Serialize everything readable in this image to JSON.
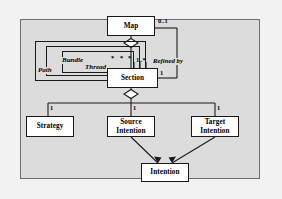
{
  "diagram": {
    "background_color": "#f2f2f2",
    "panel_color": "#dcdcdc",
    "node_fill": "#ffffff",
    "line_color": "#1a1a1a",
    "nodes": [
      {
        "id": "map",
        "label": "Map",
        "lines": [
          "Map"
        ]
      },
      {
        "id": "section",
        "label": "Section",
        "lines": [
          "Section"
        ]
      },
      {
        "id": "strategy",
        "label": "Strategy",
        "lines": [
          "Strategy"
        ]
      },
      {
        "id": "source-intention",
        "label": "Source Intention",
        "lines": [
          "Source",
          "Intention"
        ]
      },
      {
        "id": "target-intention",
        "label": "Target Intention",
        "lines": [
          "Target",
          "Intention"
        ]
      },
      {
        "id": "intention",
        "label": "Intention",
        "lines": [
          "Intention"
        ]
      }
    ],
    "self_associations": [
      {
        "id": "path",
        "label": "Path"
      },
      {
        "id": "bundle",
        "label": "Bundle"
      },
      {
        "id": "thread",
        "label": "Thread"
      }
    ],
    "edge_labels": [
      {
        "id": "refined-by",
        "label": "Refined by"
      }
    ],
    "multiplicities": [
      {
        "id": "map-0-1",
        "label": "0..1"
      },
      {
        "id": "section-1-star",
        "label": "1..*"
      },
      {
        "id": "section-refined-1",
        "label": "1"
      },
      {
        "id": "thread-star-left",
        "label": "*"
      },
      {
        "id": "thread-star-mid",
        "label": "*"
      },
      {
        "id": "thread-star-right",
        "label": "*"
      },
      {
        "id": "strategy-1",
        "label": "1"
      },
      {
        "id": "source-1",
        "label": "1"
      },
      {
        "id": "target-1",
        "label": "1"
      }
    ]
  }
}
